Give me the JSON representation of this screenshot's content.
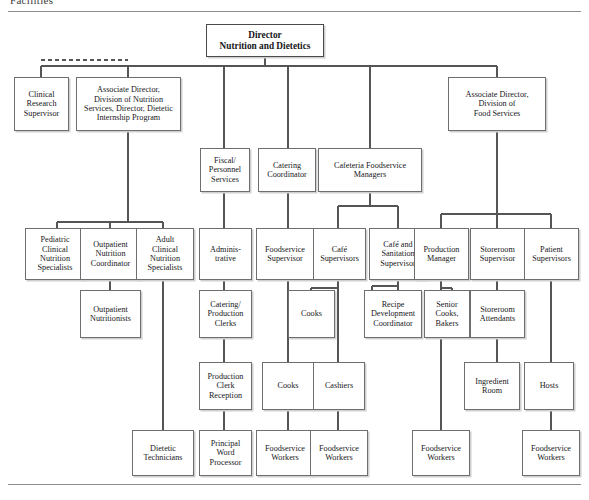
{
  "page": {
    "clipped_header": "Facilities",
    "chart_title": "Director Nutrition and Dietetics organizational chart"
  },
  "nodes": {
    "director": "Director\nNutrition and Dietetics",
    "clinical_research_supervisor": "Clinical\nResearch\nSupervisor",
    "assoc_dir_nutrition": "Associate Director,\nDivision of Nutrition\nServices, Director, Dietetic\nInternship Program",
    "assoc_dir_food": "Associate Director,\nDivision of\nFood Services",
    "fiscal_personnel": "Fiscal/\nPersonnel\nServices",
    "catering_coordinator": "Catering\nCoordinator",
    "cafeteria_managers": "Cafeteria Foodservice\nManagers",
    "pediatric_specialists": "Pediatric\nClinical\nNutrition\nSpecialists",
    "outpatient_coordinator": "Outpatient\nNutrition\nCoordinator",
    "adult_specialists": "Adult\nClinical\nNutrition\nSpecialists",
    "administrative": "Adminis-\ntrative",
    "foodservice_supervisor": "Foodservice\nSupervisor",
    "cafe_supervisors": "Café\nSupervisors",
    "cafe_sanitation_supervisor": "Café and\nSanitation\nSupervisor",
    "production_manager": "Production\nManager",
    "storeroom_supervisor": "Storeroom\nSupervisor",
    "patient_supervisors": "Patient\nSupervisors",
    "outpatient_nutritionists": "Outpatient\nNutritionists",
    "catering_production_clerks": "Catering/\nProduction\nClerks",
    "cooks_cafe": "Cooks",
    "recipe_development": "Recipe\nDevelopment\nCoordinator",
    "senior_cooks_bakers": "Senior\nCooks,\nBakers",
    "storeroom_attendants": "Storeroom\nAttendants",
    "production_clerk_reception": "Production\nClerk\nReception",
    "cooks_lower": "Cooks",
    "cashiers": "Cashiers",
    "ingredient_room": "Ingredient\nRoom",
    "hosts": "Hosts",
    "dietetic_technicians": "Dietetic\nTechnicians",
    "principal_word_processor": "Principal\nWord\nProcessor",
    "foodservice_workers_1": "Foodservice\nWorkers",
    "foodservice_workers_2": "Foodservice\nWorkers",
    "foodservice_workers_3": "Foodservice\nWorkers",
    "foodservice_workers_4": "Foodservice\nWorkers"
  },
  "colors": {
    "box_border": "#6e6e6e",
    "box_shadow": "#d0d0d0",
    "connector": "#555555",
    "rule": "#8d8d8d",
    "text": "#17171a",
    "background": "#ffffff"
  }
}
